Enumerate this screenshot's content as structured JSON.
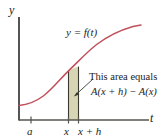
{
  "figure": {
    "axes": {
      "y_label": "y",
      "t_label": "t"
    },
    "curve": {
      "label": "y = f(t)",
      "color": "#c0505c"
    },
    "ticks": [
      {
        "name": "a",
        "label": "a"
      },
      {
        "name": "x",
        "label": "x"
      },
      {
        "name": "x-plus-h",
        "label": "x + h"
      }
    ],
    "strip": {
      "fill_color": "#d8d5b4",
      "edge_color": "#3a3a32"
    },
    "annotation": {
      "line1": "This area equals",
      "line2": "A(x + h) − A(x)"
    }
  }
}
